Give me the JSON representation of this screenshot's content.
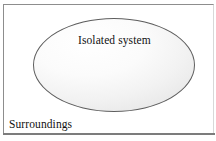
{
  "figure": {
    "type": "thermodynamic-system-diagram",
    "outer_region": {
      "name": "surroundings",
      "label": "Surroundings",
      "shape": "rectangle",
      "border_color": "#8d8d8d",
      "fill_color": "#ffffff"
    },
    "inner_region": {
      "name": "isolated-system",
      "label": "Isolated system",
      "shape": "ellipse",
      "border_color": "#5e5e5e",
      "fill_highlight_color": "#ffffff",
      "fill_shadow_color": "#d6d6d6"
    },
    "text_color": "#111111"
  }
}
